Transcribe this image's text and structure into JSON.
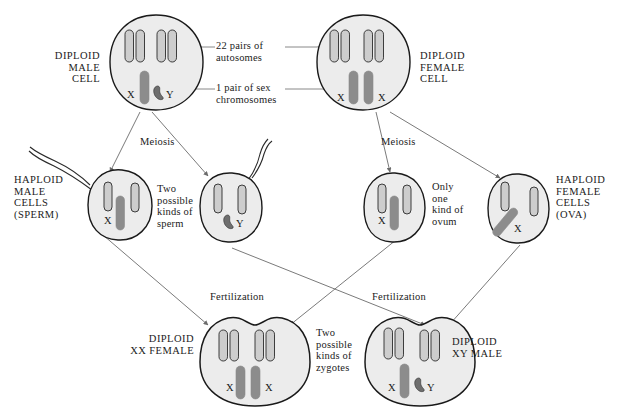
{
  "diagram": {
    "colors": {
      "cell_fill": "#ececec",
      "cell_stroke": "#1a1a1a",
      "autosome_fill": "#cdcdcd",
      "autosome_stroke": "#2a2a2a",
      "sex_chromosome_fill": "#8c8c8c",
      "line": "#6b6b6b",
      "text": "#1b1b1b",
      "background": "#ffffff"
    },
    "callouts": [
      {
        "id": "autosomes",
        "text": "22 pairs of\nautosomes"
      },
      {
        "id": "sex-chromosomes",
        "text": "1 pair of sex\nchromosomes"
      }
    ],
    "process_labels": [
      {
        "id": "meiosis-male",
        "text": "Meiosis"
      },
      {
        "id": "meiosis-female",
        "text": "Meiosis"
      },
      {
        "id": "fertilization-left",
        "text": "Fertilization"
      },
      {
        "id": "fertilization-right",
        "text": "Fertilization"
      }
    ],
    "notes": [
      {
        "id": "two-kinds-sperm",
        "text": "Two\npossible\nkinds of\nsperm"
      },
      {
        "id": "one-kind-ovum",
        "text": "Only\none\nkind of\novum"
      },
      {
        "id": "two-kinds-zygotes",
        "text": "Two\npossible\nkinds of\nzygotes"
      }
    ],
    "cells": [
      {
        "id": "diploid-male-cell",
        "label": "DIPLOID\nMALE\nCELL",
        "ploidy": "diploid",
        "autosome_count": 4,
        "sex_chromosomes": [
          "X",
          "Y"
        ],
        "has_tail": false
      },
      {
        "id": "diploid-female-cell",
        "label": "DIPLOID\nFEMALE\nCELL",
        "ploidy": "diploid",
        "autosome_count": 4,
        "sex_chromosomes": [
          "X",
          "X"
        ],
        "has_tail": false
      },
      {
        "id": "haploid-sperm-x",
        "label": "HAPLOID\nMALE\nCELLS\n(SPERM)",
        "ploidy": "haploid",
        "autosome_count": 2,
        "sex_chromosomes": [
          "X"
        ],
        "has_tail": true
      },
      {
        "id": "haploid-sperm-y",
        "label": "",
        "ploidy": "haploid",
        "autosome_count": 2,
        "sex_chromosomes": [
          "Y"
        ],
        "has_tail": true
      },
      {
        "id": "haploid-ovum-left",
        "label": "",
        "ploidy": "haploid",
        "autosome_count": 2,
        "sex_chromosomes": [
          "X"
        ],
        "has_tail": false
      },
      {
        "id": "haploid-ovum-right",
        "label": "HAPLOID\nFEMALE\nCELLS\n(OVA)",
        "ploidy": "haploid",
        "autosome_count": 2,
        "sex_chromosomes": [
          "X"
        ],
        "has_tail": false
      },
      {
        "id": "zygote-xx-female",
        "label": "DIPLOID\nXX FEMALE",
        "ploidy": "diploid",
        "autosome_count": 4,
        "sex_chromosomes": [
          "X",
          "X"
        ],
        "has_tail": false
      },
      {
        "id": "zygote-xy-male",
        "label": "DIPLOID\nXY MALE",
        "ploidy": "diploid",
        "autosome_count": 4,
        "sex_chromosomes": [
          "X",
          "Y"
        ],
        "has_tail": false
      }
    ],
    "chromosome_marks": {
      "male_parent": [
        "X",
        "Y"
      ],
      "female_parent": [
        "X",
        "X"
      ],
      "sperm_x": [
        "X"
      ],
      "sperm_y": [
        "Y"
      ],
      "ovum_left": [
        "X"
      ],
      "ovum_right": [
        "X"
      ],
      "zygote_female": [
        "X",
        "X"
      ],
      "zygote_male": [
        "X",
        "Y"
      ]
    }
  }
}
